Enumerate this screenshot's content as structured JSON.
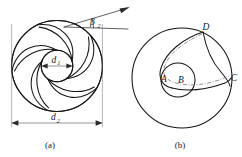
{
  "figure": {
    "panels": [
      {
        "id": "a",
        "caption": "(a)",
        "description": "Impeller with backward-curved vanes showing inlet diameter, outlet diameter and blade outlet angle",
        "labels": {
          "inner_diameter": "d",
          "inner_diameter_sub": "1",
          "outer_diameter": "d",
          "outer_diameter_sub": "2",
          "blade_angle": "β",
          "blade_angle_sub": "2"
        },
        "blade_count": 5
      },
      {
        "id": "b",
        "caption": "(b)",
        "description": "Single blade construction circles with labelled points",
        "labels": {
          "point_a": "A",
          "point_b": "B",
          "point_c": "C",
          "point_d": "D"
        }
      }
    ]
  },
  "colors": {
    "line": "#151515",
    "thin_line": "#202020",
    "dimension": "#3a3a3a",
    "extension": "#6a6a6a",
    "dashdot": "#555555",
    "text": "#1a1a1a",
    "background": "#ffffff"
  },
  "geometry": {
    "panel_a": {
      "center_x": 57,
      "center_y": 66,
      "outer_radius": 46,
      "inner_radius": 16,
      "dimension_line_y": 123,
      "dimension_left_x": 11,
      "dimension_right_x": 103,
      "inner_dim_left_x": 41,
      "inner_dim_right_x": 73,
      "inner_dim_y": 66
    },
    "panel_b": {
      "center_x": 182,
      "center_y": 78,
      "outer_radius": 50,
      "inner_radius": 17,
      "inner_center_x": 178,
      "inner_center_y": 80
    }
  }
}
